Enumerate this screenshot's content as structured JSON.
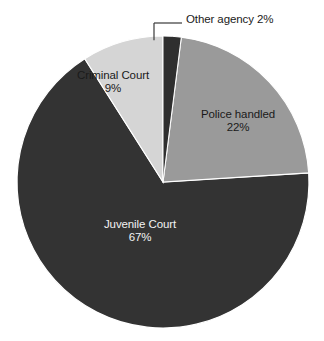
{
  "chart_data": {
    "type": "pie",
    "title": "",
    "subtitle": "",
    "xlabel": "",
    "ylabel": "",
    "legend_position": "none",
    "grid": false,
    "units": "percent",
    "categories": [
      "Other agency",
      "Police handled",
      "Juvenile Court",
      "Criminal Court"
    ],
    "values": [
      2,
      22,
      67,
      9
    ],
    "slices": [
      {
        "label": "Other agency",
        "value": 2,
        "value_text": "2%",
        "combined_text": "Other agency 2%",
        "color": "#2f2f2f",
        "text_color": "#1a1a1a",
        "label_placement": "outside-callout",
        "start_angle_deg": 0,
        "end_angle_deg": 7.2
      },
      {
        "label": "Police handled",
        "value": 22,
        "value_text": "22%",
        "color": "#9a9a9a",
        "text_color": "#1a1a1a",
        "label_placement": "inside",
        "start_angle_deg": 7.2,
        "end_angle_deg": 86.4
      },
      {
        "label": "Juvenile Court",
        "value": 67,
        "value_text": "67%",
        "color": "#333333",
        "text_color": "#f2f2f2",
        "label_placement": "inside",
        "start_angle_deg": 86.4,
        "end_angle_deg": 327.6
      },
      {
        "label": "Criminal Court",
        "value": 9,
        "value_text": "9%",
        "color": "#d5d5d5",
        "text_color": "#1a1a1a",
        "label_placement": "inside",
        "start_angle_deg": 327.6,
        "end_angle_deg": 360
      }
    ],
    "total": 100,
    "background_color": "#ffffff",
    "callout_line_color": "#3a3a3a"
  }
}
